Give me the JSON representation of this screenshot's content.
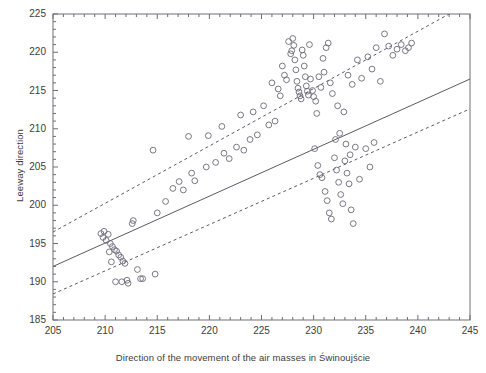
{
  "chart_data": {
    "type": "scatter",
    "title": "",
    "xlabel": "Direction of the movement of the air masses in Świnoujście",
    "ylabel": "Leeway direction",
    "xlim": [
      205,
      245
    ],
    "ylim": [
      185,
      225
    ],
    "xticks": [
      205,
      210,
      215,
      220,
      225,
      230,
      235,
      240,
      245
    ],
    "yticks": [
      185,
      190,
      195,
      200,
      205,
      210,
      215,
      220,
      225
    ],
    "xtick_minor_step": 1,
    "ytick_minor_step": 1,
    "grid": false,
    "legend": null,
    "marker": "open-circle",
    "marker_color": "#6a6a78",
    "series": [
      {
        "name": "observations",
        "points": [
          [
            209.6,
            196.3
          ],
          [
            209.8,
            195.8
          ],
          [
            209.9,
            196.6
          ],
          [
            210.1,
            195.4
          ],
          [
            210.3,
            196.2
          ],
          [
            210.5,
            195.0
          ],
          [
            210.7,
            194.6
          ],
          [
            210.9,
            194.2
          ],
          [
            211.1,
            194.0
          ],
          [
            211.3,
            193.5
          ],
          [
            211.5,
            193.2
          ],
          [
            211.7,
            192.7
          ],
          [
            211.9,
            192.4
          ],
          [
            210.4,
            193.9
          ],
          [
            210.6,
            192.6
          ],
          [
            211.0,
            190.0
          ],
          [
            211.6,
            190.0
          ],
          [
            212.1,
            190.2
          ],
          [
            212.2,
            189.8
          ],
          [
            213.1,
            191.6
          ],
          [
            213.4,
            190.4
          ],
          [
            213.6,
            190.4
          ],
          [
            214.8,
            191.0
          ],
          [
            212.7,
            198.0
          ],
          [
            212.6,
            197.6
          ],
          [
            214.6,
            207.2
          ],
          [
            215.0,
            199.0
          ],
          [
            215.8,
            200.5
          ],
          [
            216.5,
            202.2
          ],
          [
            217.1,
            203.1
          ],
          [
            217.5,
            202.0
          ],
          [
            218.3,
            204.2
          ],
          [
            218.0,
            209.0
          ],
          [
            218.6,
            203.2
          ],
          [
            219.7,
            205.0
          ],
          [
            219.9,
            209.1
          ],
          [
            220.6,
            205.6
          ],
          [
            221.2,
            210.3
          ],
          [
            221.4,
            206.8
          ],
          [
            221.9,
            206.1
          ],
          [
            222.6,
            207.6
          ],
          [
            223.0,
            211.8
          ],
          [
            223.3,
            207.2
          ],
          [
            223.9,
            208.6
          ],
          [
            224.2,
            212.2
          ],
          [
            224.6,
            209.2
          ],
          [
            225.2,
            213.0
          ],
          [
            225.7,
            210.5
          ],
          [
            226.0,
            216.0
          ],
          [
            226.3,
            211.0
          ],
          [
            226.6,
            215.2
          ],
          [
            226.8,
            214.3
          ],
          [
            227.0,
            218.2
          ],
          [
            227.2,
            217.0
          ],
          [
            227.4,
            216.4
          ],
          [
            227.6,
            221.4
          ],
          [
            227.8,
            219.8
          ],
          [
            227.9,
            220.2
          ],
          [
            228.0,
            221.8
          ],
          [
            228.1,
            220.9
          ],
          [
            228.2,
            219.0
          ],
          [
            228.3,
            217.7
          ],
          [
            228.4,
            216.2
          ],
          [
            228.5,
            215.3
          ],
          [
            228.6,
            214.8
          ],
          [
            228.7,
            214.3
          ],
          [
            228.8,
            213.9
          ],
          [
            228.9,
            220.3
          ],
          [
            229.0,
            219.6
          ],
          [
            229.1,
            218.2
          ],
          [
            229.2,
            216.8
          ],
          [
            229.3,
            215.6
          ],
          [
            229.4,
            214.9
          ],
          [
            229.5,
            214.4
          ],
          [
            229.6,
            221.0
          ],
          [
            229.7,
            216.5
          ],
          [
            229.9,
            215.0
          ],
          [
            230.0,
            214.2
          ],
          [
            230.2,
            213.6
          ],
          [
            230.3,
            212.0
          ],
          [
            230.5,
            216.8
          ],
          [
            230.7,
            215.4
          ],
          [
            230.9,
            219.2
          ],
          [
            231.0,
            217.4
          ],
          [
            231.2,
            220.6
          ],
          [
            231.4,
            221.2
          ],
          [
            231.6,
            216.0
          ],
          [
            231.8,
            214.6
          ],
          [
            230.1,
            207.4
          ],
          [
            230.4,
            205.2
          ],
          [
            230.6,
            204.0
          ],
          [
            230.8,
            203.6
          ],
          [
            231.1,
            201.8
          ],
          [
            231.3,
            200.6
          ],
          [
            231.5,
            199.0
          ],
          [
            231.7,
            198.2
          ],
          [
            232.0,
            206.2
          ],
          [
            232.2,
            204.6
          ],
          [
            232.4,
            203.0
          ],
          [
            232.6,
            201.4
          ],
          [
            232.8,
            200.2
          ],
          [
            233.0,
            205.8
          ],
          [
            233.2,
            204.2
          ],
          [
            233.4,
            202.8
          ],
          [
            233.6,
            199.4
          ],
          [
            233.8,
            197.6
          ],
          [
            232.1,
            208.6
          ],
          [
            232.5,
            209.4
          ],
          [
            233.1,
            208.0
          ],
          [
            233.5,
            206.6
          ],
          [
            234.0,
            207.6
          ],
          [
            234.4,
            203.4
          ],
          [
            232.3,
            213.0
          ],
          [
            232.9,
            212.2
          ],
          [
            233.3,
            217.0
          ],
          [
            233.7,
            215.8
          ],
          [
            234.2,
            219.0
          ],
          [
            234.6,
            216.6
          ],
          [
            235.0,
            207.4
          ],
          [
            235.4,
            205.0
          ],
          [
            235.8,
            208.2
          ],
          [
            235.2,
            219.4
          ],
          [
            235.6,
            217.8
          ],
          [
            236.0,
            220.6
          ],
          [
            236.4,
            216.2
          ],
          [
            236.8,
            222.4
          ],
          [
            237.2,
            220.8
          ],
          [
            237.6,
            219.6
          ],
          [
            238.0,
            220.4
          ],
          [
            238.4,
            221.0
          ],
          [
            238.8,
            220.2
          ],
          [
            239.1,
            220.6
          ],
          [
            239.4,
            221.2
          ]
        ]
      }
    ],
    "fit_line": {
      "name": "regression",
      "style": "solid",
      "color": "#5a5a66",
      "x1": 205,
      "y1": 192.0,
      "x2": 245,
      "y2": 216.5
    },
    "confidence_bands": [
      {
        "name": "upper-confidence-band",
        "style": "dashed",
        "color": "#5a5a66",
        "x1": 205,
        "y1": 196.5,
        "x2": 243.0,
        "y2": 225.0
      },
      {
        "name": "lower-confidence-band",
        "style": "dashed",
        "color": "#5a5a66",
        "x1": 205,
        "y1": 188.4,
        "x2": 245,
        "y2": 212.6
      }
    ]
  }
}
